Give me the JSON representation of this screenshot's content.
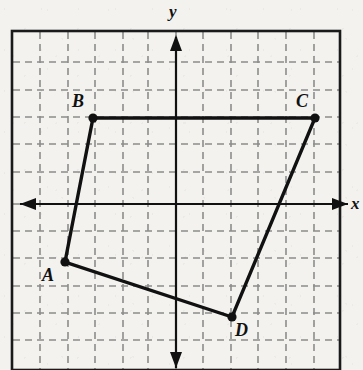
{
  "figure": {
    "kind": "coordinate-plane-quadrilateral",
    "background_color": "#f3f2ef",
    "ink_color": "#111111",
    "grid_color": "#8c8c8c",
    "frame": {
      "x": 12,
      "y": 31,
      "width": 328,
      "height": 339
    },
    "axes": {
      "x_label": "x",
      "y_label": "y",
      "x_axis_y_px": 204,
      "y_axis_x_px": 176,
      "x_label_pos": {
        "x": 352,
        "y": 196
      },
      "y_label_pos": {
        "x": 169,
        "y": 4
      },
      "arrows": [
        "left",
        "right",
        "up",
        "down"
      ]
    },
    "grid": {
      "style": "dashed",
      "spacing_px": 27.5,
      "x_lines_px": [
        40,
        68,
        95,
        123,
        148,
        176,
        203,
        231,
        258,
        286,
        314
      ],
      "y_lines_px": [
        62,
        90,
        117,
        144,
        172,
        204,
        231,
        258,
        286,
        313,
        340
      ]
    }
  },
  "chart_data": {
    "type": "scatter",
    "title": "",
    "xlabel": "x",
    "ylabel": "y",
    "grid": true,
    "legend": "none",
    "unit_px": 27.5,
    "origin_px": {
      "x": 176,
      "y": 204
    },
    "xlim": [
      -6,
      6
    ],
    "ylim": [
      -6,
      5
    ],
    "points": [
      {
        "label": "A",
        "px": {
          "x": 65,
          "y": 262
        },
        "xy": [
          -4,
          -2
        ],
        "label_pos": {
          "x": 42,
          "y": 266
        }
      },
      {
        "label": "B",
        "px": {
          "x": 93,
          "y": 118
        },
        "xy": [
          -3,
          3
        ],
        "label_pos": {
          "x": 72,
          "y": 92
        }
      },
      {
        "label": "C",
        "px": {
          "x": 315,
          "y": 118
        },
        "xy": [
          5,
          3
        ],
        "label_pos": {
          "x": 296,
          "y": 92
        }
      },
      {
        "label": "D",
        "px": {
          "x": 232,
          "y": 317
        },
        "xy": [
          2,
          -4
        ],
        "label_pos": {
          "x": 235,
          "y": 321
        }
      }
    ],
    "polygon": {
      "name": "ABCD",
      "closed": true,
      "vertex_order": [
        "A",
        "B",
        "C",
        "D"
      ],
      "edges": [
        {
          "from": "A",
          "to": "B"
        },
        {
          "from": "B",
          "to": "C"
        },
        {
          "from": "C",
          "to": "D"
        },
        {
          "from": "D",
          "to": "A"
        }
      ]
    }
  }
}
